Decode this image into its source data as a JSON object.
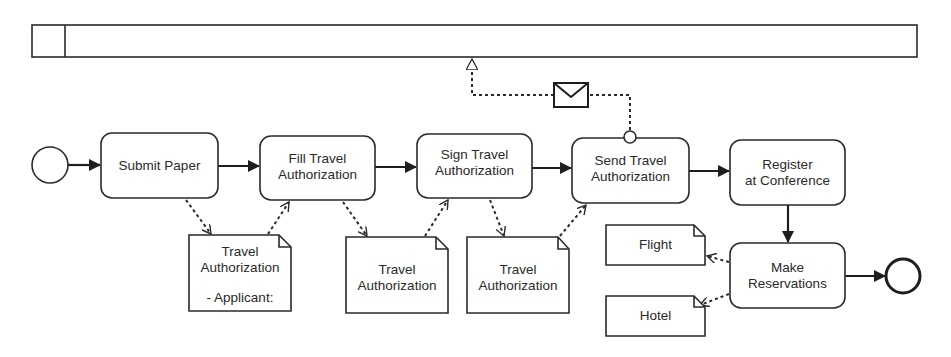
{
  "diagram": {
    "type": "BPMN process",
    "pool": {
      "label": ""
    },
    "events": {
      "start": {
        "name": "start-event"
      },
      "end": {
        "name": "end-event"
      },
      "message_boundary": {
        "name": "message-intermediate-event"
      }
    },
    "tasks": [
      {
        "id": "t1",
        "line1": "Submit Paper",
        "line2": ""
      },
      {
        "id": "t2",
        "line1": "Fill Travel",
        "line2": "Authorization"
      },
      {
        "id": "t3",
        "line1": "Sign Travel",
        "line2": "Authorization"
      },
      {
        "id": "t4",
        "line1": "Send Travel",
        "line2": "Authorization"
      },
      {
        "id": "t5",
        "line1": "Register",
        "line2": "at Conference"
      },
      {
        "id": "t6",
        "line1": "Make",
        "line2": "Reservations"
      }
    ],
    "data_objects": [
      {
        "id": "d1",
        "line1": "Travel",
        "line2": "Authorization",
        "line3": "- Applicant:"
      },
      {
        "id": "d2",
        "line1": "Travel",
        "line2": "Authorization",
        "line3": ""
      },
      {
        "id": "d3",
        "line1": "Travel",
        "line2": "Authorization",
        "line3": ""
      },
      {
        "id": "d4",
        "line1": "Flight",
        "line2": "",
        "line3": ""
      },
      {
        "id": "d5",
        "line1": "Hotel",
        "line2": "",
        "line3": ""
      }
    ],
    "message": {
      "icon": "envelope-icon"
    },
    "sequence_flows": [
      [
        "start",
        "Submit Paper"
      ],
      [
        "Submit Paper",
        "Fill Travel Authorization"
      ],
      [
        "Fill Travel Authorization",
        "Sign Travel Authorization"
      ],
      [
        "Sign Travel Authorization",
        "Send Travel Authorization"
      ],
      [
        "Send Travel Authorization",
        "Register at Conference"
      ],
      [
        "Register at Conference",
        "Make Reservations"
      ],
      [
        "Make Reservations",
        "end"
      ]
    ],
    "colors": {
      "stroke": "#2a2a2a",
      "fill": "#ffffff"
    }
  }
}
